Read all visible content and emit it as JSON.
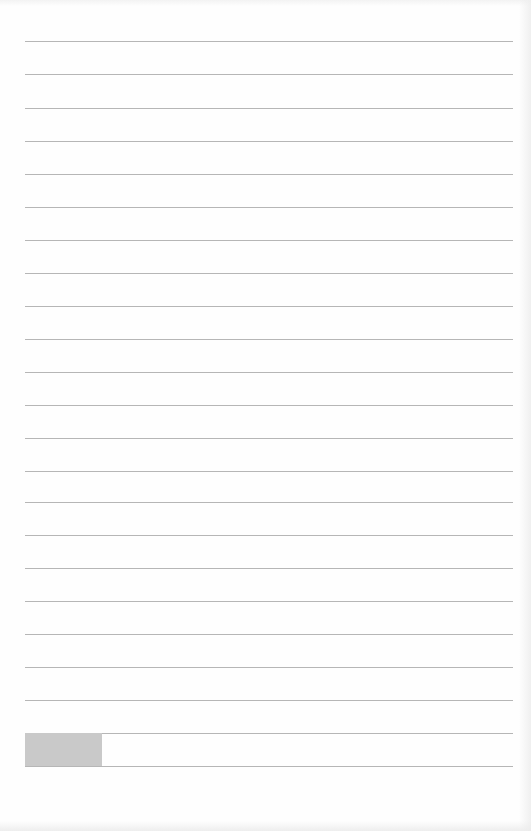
{
  "document": {
    "type": "lined-paper",
    "rule_color": "#a9a9a9",
    "rule_left": 25,
    "rule_width": 488,
    "rules_y": [
      41,
      74,
      108,
      141,
      174,
      207,
      240,
      273,
      306,
      339,
      372,
      405,
      438,
      471,
      502,
      535,
      568,
      601,
      634,
      667,
      700,
      733,
      766
    ],
    "gray_block": {
      "color": "#c9c9c9",
      "x": 25,
      "y": 733,
      "width": 77,
      "height": 33
    }
  }
}
